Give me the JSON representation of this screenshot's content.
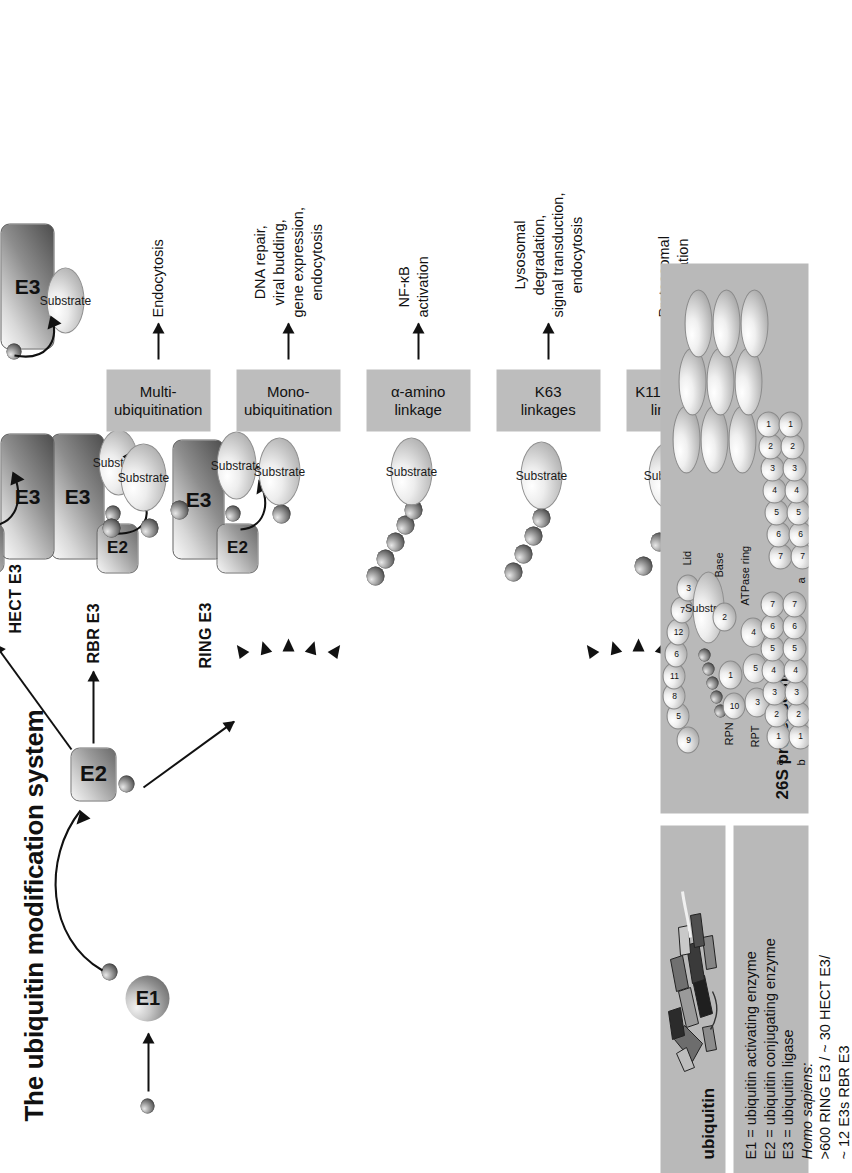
{
  "figure": {
    "title": "The ubiquitin modification system",
    "orientation": "rotated-90-ccw"
  },
  "pathway": {
    "ubiquitin_label": "ubiquitin",
    "e1_label": "E1",
    "e2_label": "E2",
    "e3_label": "E3",
    "substrate_label": "Substrate",
    "e3_classes": [
      {
        "name": "RING E3"
      },
      {
        "name": "RBR E3"
      },
      {
        "name": "HECT E3"
      }
    ]
  },
  "legend_panel": {
    "lines": [
      "E1 = ubiquitin activating enzyme",
      "E2 = ubiquitin conjugating enzyme",
      "E3 = ubiquitin ligase",
      "Homo sapiens:",
      ">600 RING E3 / ~ 30 HECT E3/",
      "~ 12 E3s RBR E3"
    ],
    "italic_index": 3
  },
  "ubiquitin_panel": {
    "title": "ubiquitin"
  },
  "proteasome_panel": {
    "title": "26S proteasome",
    "labels": [
      "Lid",
      "Substrate",
      "Base",
      "ATPase ring",
      "RPN",
      "RPT"
    ],
    "rpn_numbers": [
      "9",
      "5",
      "8",
      "11",
      "6",
      "12",
      "7",
      "3",
      "10",
      "1",
      "2"
    ],
    "rpt_numbers": [
      "3",
      "5",
      "4"
    ],
    "ring_rows": [
      {
        "name": "a",
        "numbers": [
          "1",
          "2",
          "3",
          "4",
          "5",
          "6",
          "7"
        ]
      },
      {
        "name": "b",
        "numbers": [
          "1",
          "2",
          "3",
          "4",
          "5",
          "6",
          "7"
        ]
      },
      {
        "name": "b",
        "numbers": [
          "7",
          "6",
          "5",
          "4",
          "3",
          "2",
          "1"
        ]
      },
      {
        "name": "a",
        "numbers": [
          "7",
          "6",
          "5",
          "4",
          "3",
          "2",
          "1"
        ]
      }
    ]
  },
  "outcomes": [
    {
      "class": "K11 and K48\nlinkages",
      "class_line1": "K11 and K48",
      "class_line2": "linkages",
      "ub_type": "branched-chain",
      "ub_count": 4,
      "result_lines": [
        "Proteasomal",
        "degradation"
      ]
    },
    {
      "class": "K63\nlinkages",
      "class_line1": "K63",
      "class_line2": "linkages",
      "ub_type": "poly-chain",
      "ub_count": 4,
      "result_lines": [
        "Lysosomal",
        "degradation,",
        "signal transduction,",
        "endocytosis"
      ]
    },
    {
      "class": "α-amino\nlinkage",
      "class_line1": "α-amino",
      "class_line2": "linkage",
      "ub_type": "poly-chain",
      "ub_count": 5,
      "result_lines": [
        "NF-κB",
        "activation"
      ]
    },
    {
      "class": "Mono-\nubiquitination",
      "class_line1": "Mono-",
      "class_line2": "ubiquitination",
      "ub_type": "single",
      "ub_count": 1,
      "result_lines": [
        "DNA repair,",
        "viral budding,",
        "gene expression,",
        "endocytosis"
      ]
    },
    {
      "class": "Multi-\nubiquitination",
      "class_line1": "Multi-",
      "class_line2": "ubiquitination",
      "ub_type": "multi-mono",
      "ub_count": 3,
      "result_lines": [
        "Endocytosis"
      ]
    }
  ],
  "colors": {
    "panel_bg": "#b9b9b9",
    "class_box_bg": "#bdbdbd",
    "ink": "#111111",
    "page_bg": "#ffffff"
  }
}
